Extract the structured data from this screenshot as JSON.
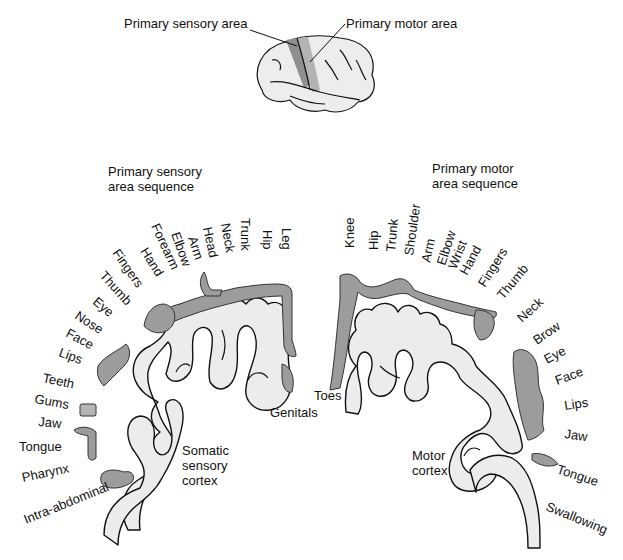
{
  "colors": {
    "background": "#ffffff",
    "cortex_fill": "#ececec",
    "cortex_outline": "#111111",
    "homunculus_fill": "#9c9c9c",
    "sensory_strip": "#8f8f8f",
    "motor_strip": "#b3b3b3",
    "text": "#111111"
  },
  "brain_inset": {
    "label_sensory": "Primary sensory area",
    "label_motor": "Primary motor area"
  },
  "sensory": {
    "title_line1": "Primary sensory",
    "title_line2": "area sequence",
    "cortex_label_line1": "Somatic",
    "cortex_label_line2": "sensory",
    "cortex_label_line3": "cortex",
    "labels": [
      {
        "text": "Leg",
        "x": 282,
        "y": 228,
        "rot": 90
      },
      {
        "text": "Hip",
        "x": 263,
        "y": 230,
        "rot": 90
      },
      {
        "text": "Trunk",
        "x": 241,
        "y": 218,
        "rot": 90
      },
      {
        "text": "Neck",
        "x": 221,
        "y": 224,
        "rot": 80
      },
      {
        "text": "Head",
        "x": 203,
        "y": 228,
        "rot": 78
      },
      {
        "text": "Arm",
        "x": 188,
        "y": 238,
        "rot": 72
      },
      {
        "text": "Elbow",
        "x": 171,
        "y": 234,
        "rot": 70
      },
      {
        "text": "Forearm",
        "x": 151,
        "y": 226,
        "rot": 65
      },
      {
        "text": "Hand",
        "x": 140,
        "y": 251,
        "rot": 58
      },
      {
        "text": "Fingers",
        "x": 112,
        "y": 253,
        "rot": 55
      },
      {
        "text": "Thumb",
        "x": 99,
        "y": 276,
        "rot": 48
      },
      {
        "text": "Eye",
        "x": 92,
        "y": 303,
        "rot": 40
      },
      {
        "text": "Nose",
        "x": 74,
        "y": 318,
        "rot": 33
      },
      {
        "text": "Face",
        "x": 65,
        "y": 336,
        "rot": 28
      },
      {
        "text": "Lips",
        "x": 58,
        "y": 356,
        "rot": 20
      },
      {
        "text": "Teeth",
        "x": 42,
        "y": 382,
        "rot": 12
      },
      {
        "text": "Gums",
        "x": 34,
        "y": 403,
        "rot": 10
      },
      {
        "text": "Jaw",
        "x": 38,
        "y": 426,
        "rot": 5
      },
      {
        "text": "Tongue",
        "x": 19,
        "y": 451,
        "rot": 0
      },
      {
        "text": "Pharynx",
        "x": 23,
        "y": 482,
        "rot": -12
      },
      {
        "text": "Intra-abdominal",
        "x": 26,
        "y": 524,
        "rot": -22
      },
      {
        "text": "Genitals",
        "x": 270,
        "y": 417,
        "rot": 0
      }
    ]
  },
  "motor": {
    "title_line1": "Primary motor",
    "title_line2": "area sequence",
    "cortex_label_line1": "Motor",
    "cortex_label_line2": "cortex",
    "labels": [
      {
        "text": "Knee",
        "x": 354,
        "y": 248,
        "rot": -90
      },
      {
        "text": "Hip",
        "x": 378,
        "y": 250,
        "rot": -90
      },
      {
        "text": "Trunk",
        "x": 395,
        "y": 252,
        "rot": -85
      },
      {
        "text": "Shoulder",
        "x": 413,
        "y": 256,
        "rot": -82
      },
      {
        "text": "Arm",
        "x": 430,
        "y": 263,
        "rot": -78
      },
      {
        "text": "Elbow",
        "x": 445,
        "y": 266,
        "rot": -72
      },
      {
        "text": "Wrist",
        "x": 456,
        "y": 270,
        "rot": -68
      },
      {
        "text": "Hand",
        "x": 467,
        "y": 276,
        "rot": -62
      },
      {
        "text": "Fingers",
        "x": 485,
        "y": 288,
        "rot": -58
      },
      {
        "text": "Thumb",
        "x": 503,
        "y": 300,
        "rot": -50
      },
      {
        "text": "Neck",
        "x": 522,
        "y": 323,
        "rot": -42
      },
      {
        "text": "Brow",
        "x": 537,
        "y": 345,
        "rot": -35
      },
      {
        "text": "Eye",
        "x": 547,
        "y": 364,
        "rot": -28
      },
      {
        "text": "Face",
        "x": 557,
        "y": 385,
        "rot": -20
      },
      {
        "text": "Lips",
        "x": 565,
        "y": 410,
        "rot": -8
      },
      {
        "text": "Jaw",
        "x": 564,
        "y": 438,
        "rot": 8
      },
      {
        "text": "Tongue",
        "x": 556,
        "y": 473,
        "rot": 18
      },
      {
        "text": "Swallowing",
        "x": 545,
        "y": 510,
        "rot": 22
      },
      {
        "text": "Toes",
        "x": 314,
        "y": 400,
        "rot": 0
      }
    ]
  }
}
